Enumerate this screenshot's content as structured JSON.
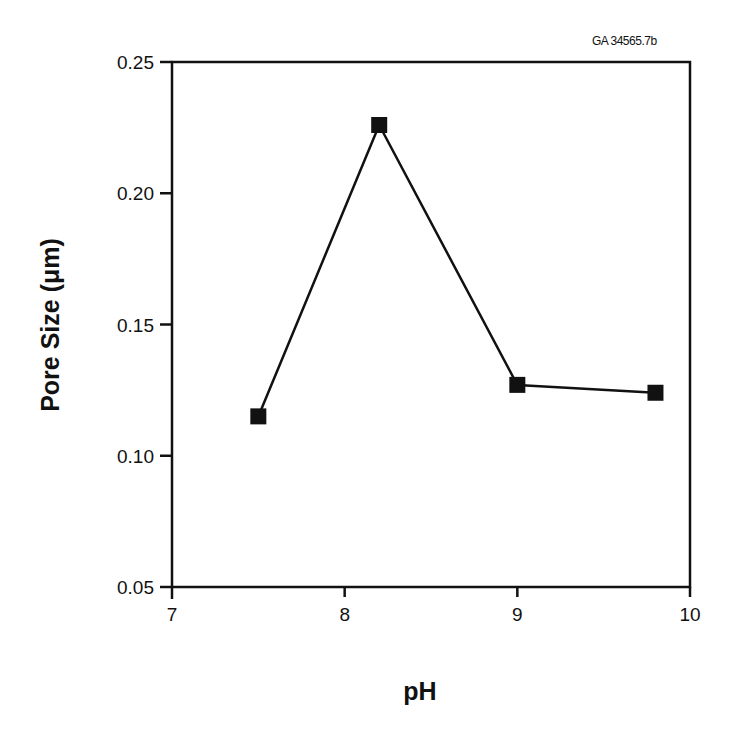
{
  "figure_id": "GA 34565.7b",
  "chart_data": {
    "type": "line",
    "title": "",
    "xlabel": "pH",
    "ylabel": "Pore Size (μm)",
    "xlim": [
      7,
      10
    ],
    "ylim": [
      0.05,
      0.25
    ],
    "x_ticks": [
      7,
      8,
      9,
      10
    ],
    "x_tick_labels": [
      "7",
      "8",
      "9",
      "10"
    ],
    "y_ticks": [
      0.05,
      0.1,
      0.15,
      0.2,
      0.25
    ],
    "y_tick_labels": [
      "0.05",
      "0.10",
      "0.15",
      "0.20",
      "0.25"
    ],
    "grid": false,
    "legend": null,
    "marker": "filled-square",
    "series": [
      {
        "name": "Pore Size",
        "x": [
          7.5,
          8.2,
          9.0,
          9.8
        ],
        "values": [
          0.115,
          0.226,
          0.127,
          0.124
        ],
        "color": "#111111"
      }
    ]
  },
  "colors": {
    "line": "#111111",
    "marker": "#111111",
    "axis": "#111111",
    "background": "#ffffff"
  }
}
